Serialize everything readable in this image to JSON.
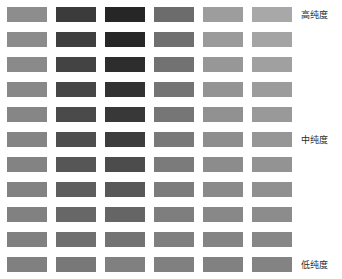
{
  "chart_data": {
    "type": "heatmap",
    "title": "",
    "xlabel": "",
    "ylabel": "",
    "grid": false,
    "legend_position": "right",
    "columns": 6,
    "rows": 11,
    "column_names": [
      "col-1",
      "col-2",
      "col-3",
      "col-4",
      "col-5",
      "col-6"
    ],
    "row_names": [
      "row-1",
      "row-2",
      "row-3",
      "row-4",
      "row-5",
      "row-6",
      "row-7",
      "row-8",
      "row-9",
      "row-10",
      "row-11"
    ],
    "row_labels": [
      "高纯度",
      "",
      "",
      "",
      "",
      "中纯度",
      "",
      "",
      "",
      "",
      "低纯度"
    ],
    "annotations": [
      {
        "text": "高纯度",
        "row": 1,
        "position": "right"
      },
      {
        "text": "中纯度",
        "row": 6,
        "position": "right"
      },
      {
        "text": "低纯度",
        "row": 11,
        "position": "right"
      }
    ],
    "swatch_colors": [
      [
        "#8d8d8d",
        "#3b3b3b",
        "#262626",
        "#6c6c6c",
        "#9d9d9d",
        "#a8a8a8"
      ],
      [
        "#8b8b8b",
        "#3f3f3f",
        "#272727",
        "#6f6f6f",
        "#9a9a9a",
        "#a4a4a4"
      ],
      [
        "#8a8a8a",
        "#434343",
        "#2d2d2d",
        "#727272",
        "#979797",
        "#a0a0a0"
      ],
      [
        "#888888",
        "#464646",
        "#323232",
        "#747474",
        "#949494",
        "#9c9c9c"
      ],
      [
        "#868686",
        "#4a4a4a",
        "#383838",
        "#767676",
        "#919191",
        "#999999"
      ],
      [
        "#848484",
        "#4e4e4e",
        "#3d3d3d",
        "#797979",
        "#8e8e8e",
        "#969696"
      ],
      [
        "#838383",
        "#565656",
        "#4c4c4c",
        "#7b7b7b",
        "#8c8c8c",
        "#939393"
      ],
      [
        "#828282",
        "#5e5e5e",
        "#585858",
        "#7c7c7c",
        "#8a8a8a",
        "#909090"
      ],
      [
        "#818181",
        "#676767",
        "#656565",
        "#7e7e7e",
        "#888888",
        "#8c8c8c"
      ],
      [
        "#808080",
        "#6f6f6f",
        "#737373",
        "#7f7f7f",
        "#848484",
        "#878787"
      ],
      [
        "#808080",
        "#787878",
        "#808080",
        "#808080",
        "#818181",
        "#838383"
      ]
    ],
    "swatch_values": [
      [
        141,
        59,
        38,
        108,
        157,
        168
      ],
      [
        139,
        63,
        39,
        111,
        154,
        164
      ],
      [
        138,
        67,
        45,
        114,
        151,
        160
      ],
      [
        136,
        70,
        50,
        116,
        148,
        156
      ],
      [
        134,
        74,
        56,
        118,
        145,
        153
      ],
      [
        132,
        78,
        61,
        121,
        142,
        150
      ],
      [
        131,
        86,
        76,
        123,
        140,
        147
      ],
      [
        130,
        94,
        88,
        124,
        138,
        144
      ],
      [
        129,
        103,
        101,
        126,
        136,
        140
      ],
      [
        128,
        111,
        115,
        127,
        132,
        135
      ],
      [
        128,
        120,
        128,
        128,
        129,
        131
      ]
    ]
  },
  "layout": {
    "swatch_width": 40,
    "swatch_height": 15,
    "column_gap": 9,
    "row_gap": 10,
    "origin_x": 7,
    "origin_y": 7
  },
  "labels": {
    "high_purity": "高纯度",
    "medium_purity": "中纯度",
    "low_purity": "低纯度"
  }
}
